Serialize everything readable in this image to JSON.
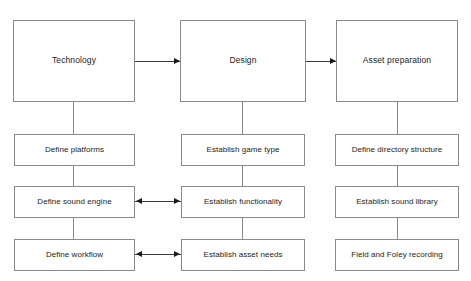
{
  "diagram": {
    "type": "flowchart",
    "title_visible": false,
    "background_color": "#ffffff",
    "box_border_color": "#8a8a8a",
    "connector_color": "#3a3a3a",
    "text_color": "#1c1c1c",
    "columns": [
      {
        "id": "technology",
        "stage": {
          "label": "Technology"
        },
        "tasks": [
          {
            "label": "Define platforms"
          },
          {
            "label": "Define sound engine"
          },
          {
            "label": "Define workflow"
          }
        ]
      },
      {
        "id": "design",
        "stage": {
          "label": "Design"
        },
        "tasks": [
          {
            "label": "Establish game type"
          },
          {
            "label": "Establish functionality"
          },
          {
            "label": "Establish asset needs"
          }
        ]
      },
      {
        "id": "asset-preparation",
        "stage": {
          "label": "Asset preparation"
        },
        "tasks": [
          {
            "label": "Define directory structure"
          },
          {
            "label": "Establish sound library"
          },
          {
            "label": "Field and Foley recording"
          }
        ]
      }
    ],
    "connectors": [
      {
        "id": "technology-to-design",
        "kind": "arrow-right"
      },
      {
        "id": "design-to-asset-preparation",
        "kind": "arrow-right"
      },
      {
        "id": "sound-engine-to-functionality",
        "kind": "arrow-double"
      },
      {
        "id": "workflow-to-asset-needs",
        "kind": "arrow-double"
      }
    ]
  }
}
